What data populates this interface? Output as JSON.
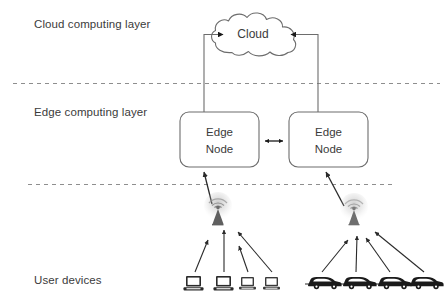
{
  "figure": {
    "type": "architecture-diagram",
    "background": "#ffffff",
    "stroke": "#6d6d6d",
    "dark_icon_color": "#1a1a1a",
    "text_color": "#3b3b3b"
  },
  "layers": [
    {
      "id": "cloud",
      "label": "Cloud computing layer"
    },
    {
      "id": "edge",
      "label": "Edge computing layer"
    },
    {
      "id": "user",
      "label": "User devices"
    }
  ],
  "nodes": {
    "cloud": {
      "label": "Cloud"
    },
    "edge_left": {
      "line1": "Edge",
      "line2": "Node"
    },
    "edge_right": {
      "line1": "Edge",
      "line2": "Node"
    }
  },
  "icons": {
    "tower_left": "cell-tower-icon",
    "tower_right": "cell-tower-icon",
    "devices_left": [
      "computer-icon",
      "computer-icon",
      "computer-icon",
      "computer-icon"
    ],
    "devices_right": [
      "car-icon",
      "car-icon",
      "car-icon",
      "car-icon"
    ]
  },
  "connections": {
    "edge_left_to_cloud": "arrow-up-into-cloud",
    "edge_right_to_cloud": "arrow-up-into-cloud",
    "edge_to_edge": "bidirectional-arrow",
    "tower_left_to_edge_left": "arrow-up",
    "tower_right_to_edge_right": "arrow-up",
    "devices_to_tower_left": 4,
    "devices_to_tower_right": 4
  },
  "dividers": [
    {
      "id": "cloud-edge-divider",
      "style": "dashed"
    },
    {
      "id": "edge-user-divider",
      "style": "dashed"
    }
  ]
}
